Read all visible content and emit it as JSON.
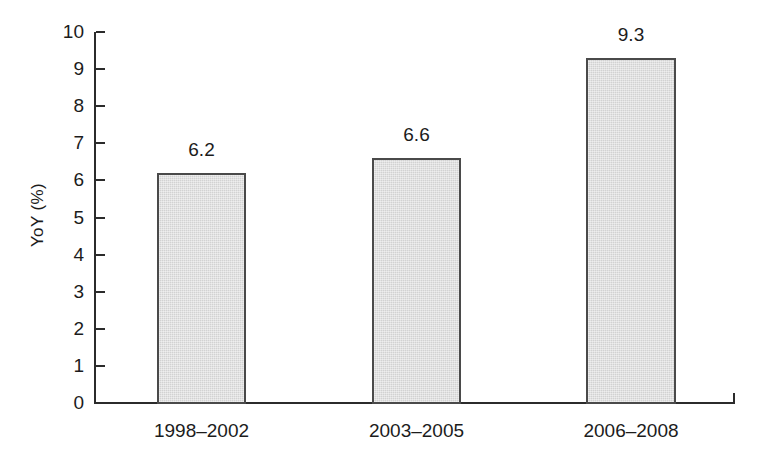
{
  "chart_data": {
    "type": "bar",
    "title": "",
    "subtitle": "",
    "xlabel": "",
    "ylabel": "YoY (%)",
    "categories": [
      "1998–2002",
      "2003–2005",
      "2006–2008"
    ],
    "values": [
      6.2,
      6.6,
      9.3
    ],
    "value_labels": [
      "6.2",
      "6.6",
      "9.3"
    ],
    "ylim": [
      0,
      10
    ],
    "ytick_step": 1,
    "ytick_labels": [
      "0",
      "1",
      "2",
      "3",
      "4",
      "5",
      "6",
      "7",
      "8",
      "9",
      "10"
    ],
    "grid": false,
    "legend": null,
    "legend_position": "none",
    "annotations": [],
    "colors": {
      "background": "#ffffff",
      "bar_fill": "#d2d2d2",
      "bar_border": "#4a4a4a",
      "axis": "#2b2b2b",
      "text": "#1c1c1c"
    }
  }
}
